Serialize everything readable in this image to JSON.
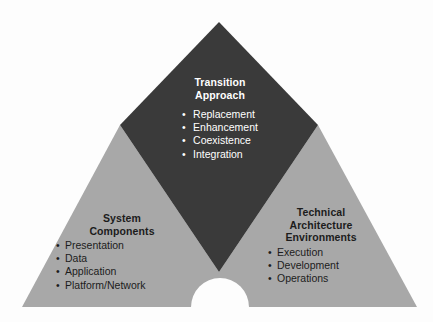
{
  "diagram": {
    "type": "triangle-three-part",
    "colors": {
      "background": "#fdfdfd",
      "center_fill": "#3a3a3a",
      "side_fill": "#a8a8a8",
      "notch_fill": "#fdfdfd",
      "center_text": "#ffffff",
      "side_text": "#1c1c1c"
    },
    "center": {
      "heading_line1": "Transition",
      "heading_line2": "Approach",
      "bullet_char": "•",
      "bullets": [
        "Replacement",
        "Enhancement",
        "Coexistence",
        "Integration"
      ]
    },
    "left": {
      "heading_line1": "System",
      "heading_line2": "Components",
      "bullet_char": "•",
      "bullets": [
        "Presentation",
        "Data",
        "Application",
        "Platform/Network"
      ]
    },
    "right": {
      "heading_line1": "Technical",
      "heading_line2": "Architecture",
      "heading_line3": "Environments",
      "bullet_char": "•",
      "bullets": [
        "Execution",
        "Development",
        "Operations"
      ]
    }
  }
}
